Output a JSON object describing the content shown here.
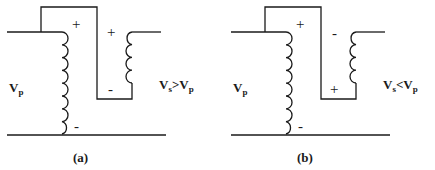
{
  "diagrams": [
    {
      "caption": "(a)",
      "primary": {
        "label_main": "V",
        "label_sub": "p",
        "polarity_top": "+",
        "polarity_bottom": "-"
      },
      "secondary": {
        "polarity_top": "+",
        "polarity_bottom": "-",
        "label": {
          "v1": "V",
          "s1": "s",
          "op": ">",
          "v2": "V",
          "s2": "p"
        }
      }
    },
    {
      "caption": "(b)",
      "primary": {
        "label_main": "V",
        "label_sub": "p",
        "polarity_top": "+",
        "polarity_bottom": "-"
      },
      "secondary": {
        "polarity_top": "-",
        "polarity_bottom": "+",
        "label": {
          "v1": "V",
          "s1": "s",
          "op": "<",
          "v2": "V",
          "s2": "p"
        }
      }
    }
  ]
}
